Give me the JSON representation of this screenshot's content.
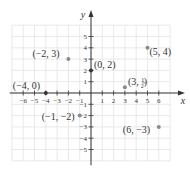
{
  "chart_data": {
    "type": "scatter",
    "title": "",
    "xlabel": "x",
    "ylabel": "y",
    "xlim": [
      -6,
      6
    ],
    "ylim": [
      -5,
      5
    ],
    "grid": true,
    "x_ticks": [
      -6,
      -5,
      -4,
      -3,
      -2,
      -1,
      1,
      2,
      3,
      4,
      5,
      6
    ],
    "y_ticks": [
      -5,
      -4,
      -3,
      -2,
      -1,
      1,
      2,
      3,
      4,
      5
    ],
    "points": [
      {
        "x": -2,
        "y": 3,
        "label": "(−2, 3)"
      },
      {
        "x": 0,
        "y": 2,
        "label": "(0, 2)"
      },
      {
        "x": 5,
        "y": 4,
        "label": "(5, 4)"
      },
      {
        "x": -4,
        "y": 0,
        "label": "(−4, 0)"
      },
      {
        "x": 3,
        "y": 0.5,
        "label": "(3, 1/2)"
      },
      {
        "x": -1,
        "y": -2,
        "label": "(−1, −2)"
      },
      {
        "x": 6,
        "y": -3,
        "label": "(6, −3)"
      }
    ]
  },
  "colors": {
    "grid": "#e4e4e4",
    "axis": "#333333",
    "point": "#8a8a8a",
    "axis_point": "#333333",
    "text": "#333333"
  }
}
